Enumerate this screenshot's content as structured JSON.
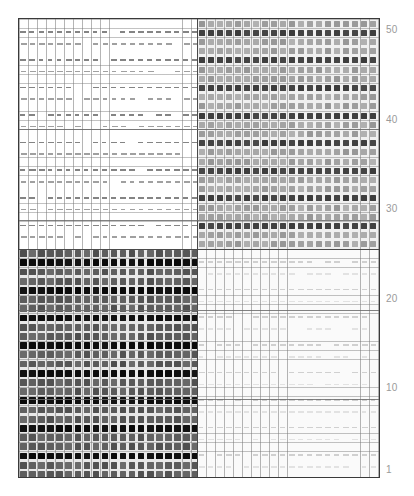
{
  "figure": {
    "title": "",
    "background": "#ffffff",
    "frame_color": "#3a3a3a",
    "gridline_color": "#787878",
    "major_gridline_color": "#4a4a4a"
  },
  "axis": {
    "position": "right",
    "label": "",
    "tick_color": "#9a9a9a",
    "ticks": [
      {
        "label": "50",
        "value": 50,
        "y": 30
      },
      {
        "label": "40",
        "value": 40,
        "y": 120
      },
      {
        "label": "30",
        "value": 30,
        "y": 209
      },
      {
        "label": "20",
        "value": 20,
        "y": 299
      },
      {
        "label": "10",
        "value": 10,
        "y": 388
      },
      {
        "label": "1",
        "value": 1,
        "y": 470
      }
    ]
  },
  "quadrants": [
    {
      "name": "top-left",
      "fill_level": "sparse-white",
      "cell_color": "#7d7d7d",
      "background": "#ffffff"
    },
    {
      "name": "top-right",
      "fill_level": "dense-gray",
      "cell_color": "#9e9e9e",
      "background": "#f0f0f0"
    },
    {
      "name": "bottom-left",
      "fill_level": "dense-dark",
      "cell_color": "#5a5a5a",
      "background": "#e8e8e8"
    },
    {
      "name": "bottom-right",
      "fill_level": "sparse-faint",
      "cell_color": "#dcdcdc",
      "background": "#fafafa"
    }
  ],
  "chart_data": {
    "type": "heatmap",
    "title": "",
    "xlabel": "",
    "ylabel": "",
    "grid": true,
    "legend": null,
    "axis_side": "right",
    "ylim": [
      1,
      50
    ],
    "ytick_labels": [
      "50",
      "40",
      "30",
      "20",
      "10",
      "1"
    ],
    "ytick_values": [
      50,
      40,
      30,
      20,
      10,
      1
    ],
    "columns": 40,
    "rows": 50,
    "quadrant_split": {
      "x_fraction": 0.49,
      "y_fraction": 0.5
    },
    "quadrant_intensity": {
      "top_left": 0.08,
      "top_right": 0.45,
      "bottom_left": 0.78,
      "bottom_right": 0.05
    },
    "row_band_period": 3,
    "row_band_emphasis": "every third row rendered darker",
    "values_note": "each grid cell holds a short horizontal dash whose darkness encodes magnitude"
  }
}
